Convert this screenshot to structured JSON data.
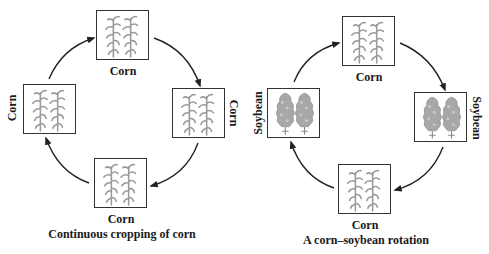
{
  "diagrams": [
    {
      "id": "continuous",
      "caption": "Continuous cropping of corn",
      "nodes": [
        {
          "position": "top",
          "crop": "corn",
          "label": "Corn"
        },
        {
          "position": "right",
          "crop": "corn",
          "label": "Corn"
        },
        {
          "position": "bottom",
          "crop": "corn",
          "label": "Corn"
        },
        {
          "position": "left",
          "crop": "corn",
          "label": "Corn"
        }
      ],
      "cycle_direction": "clockwise"
    },
    {
      "id": "rotation",
      "caption": "A corn–soybean rotation",
      "nodes": [
        {
          "position": "top",
          "crop": "corn",
          "label": "Corn"
        },
        {
          "position": "right",
          "crop": "soybean",
          "label": "Soybean"
        },
        {
          "position": "bottom",
          "crop": "corn",
          "label": "Corn"
        },
        {
          "position": "left",
          "crop": "soybean",
          "label": "Soybean"
        }
      ],
      "cycle_direction": "clockwise"
    }
  ],
  "icons": {
    "corn": "corn-plant-icon",
    "soybean": "soybean-plant-icon"
  },
  "colors": {
    "plant": "#9a9a9a",
    "box_border": "#333333",
    "arrow": "#222222",
    "text": "#1a1a1a"
  }
}
